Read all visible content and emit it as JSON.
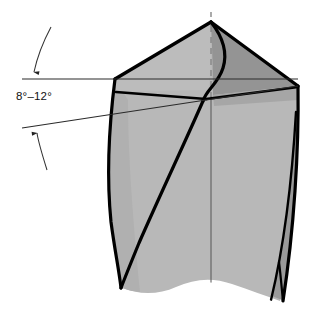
{
  "figure": {
    "name": "drill-point-lip-relief-angle-diagram",
    "view": "end-of-point-perspective",
    "annotation": {
      "label": "8°–12°",
      "meaning": "lip-relief-angle",
      "leader_style": "curved-arrow",
      "arrow_count": 2
    },
    "colors": {
      "outline": "#000000",
      "background": "#ffffff",
      "flank_light": "#b8b8b8",
      "flank_medium": "#a8a8a8",
      "flank_dark": "#8f8f8f",
      "land_shadow": "#9a9a9a",
      "thin_line": "#2a2a2a",
      "axis_line": "#555555",
      "label_color": "#111111"
    },
    "parts": [
      {
        "name": "drill-axis-centerline",
        "style": "dashed-above-tip-solid-below"
      },
      {
        "name": "chisel-edge",
        "style": "s-curve"
      },
      {
        "name": "cutting-lip-left",
        "style": "thick-outline"
      },
      {
        "name": "cutting-lip-right",
        "style": "thick-outline"
      },
      {
        "name": "flank-face-left",
        "shade": "light-gray"
      },
      {
        "name": "flank-face-right",
        "shade": "dark-gray"
      },
      {
        "name": "flute-line-left",
        "style": "thick-curve"
      },
      {
        "name": "margin-land-right",
        "style": "narrow-strip"
      },
      {
        "name": "body-broken-bottom",
        "style": "wavy-break-line"
      },
      {
        "name": "reference-line-horizontal",
        "style": "thin"
      },
      {
        "name": "reference-line-inclined",
        "style": "thin"
      }
    ]
  },
  "geometry": {
    "apex": {
      "x": 211,
      "y": 22
    },
    "left_corner": {
      "x": 115,
      "y": 79
    },
    "right_corner": {
      "x": 298,
      "y": 86
    },
    "axis_top": {
      "x": 211,
      "y": 12
    },
    "axis_bottom": {
      "x": 211,
      "y": 299
    },
    "horizontal_line": {
      "x1": 22,
      "y1": 79,
      "x2": 298,
      "y2": 79
    },
    "inclined_line": {
      "x1": 22,
      "y1": 128,
      "x2": 298,
      "y2": 86
    }
  }
}
